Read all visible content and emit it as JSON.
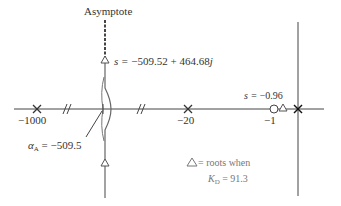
{
  "diagram": {
    "type": "root-locus",
    "colors": {
      "axis": "#333333",
      "locus": "#555555",
      "annotation": "#777777"
    },
    "labels": {
      "asymptote": "Asymptote",
      "complex_root_prefix": "s = ",
      "complex_root_value": "−509.52 + 464.68",
      "complex_root_j": "j",
      "real_root_prefix": "s = ",
      "real_root_value": "−0.96",
      "alpha_symbol": "α",
      "alpha_sub": "A",
      "alpha_value": " = −509.5",
      "legend_line1": " = roots when",
      "legend_k": "K",
      "legend_k_sub": "D",
      "legend_k_value": " = 91.3"
    },
    "tick_labels": {
      "pole_1000": "−1000",
      "pole_20": "−20",
      "zero_1": "−1"
    },
    "poles": [
      {
        "value": -1000,
        "label": "−1000"
      },
      {
        "value": -20,
        "label": "−20"
      },
      {
        "value": 0,
        "label": ""
      }
    ],
    "zeros": [
      {
        "value": -1,
        "label": "−1"
      }
    ],
    "roots_at_gain": {
      "gain_symbol": "K_D",
      "gain": 91.3,
      "roots": [
        "−509.52 + 464.68j",
        "−509.52 − 464.68j",
        "−0.96"
      ]
    },
    "asymptote_centroid": -509.5
  }
}
